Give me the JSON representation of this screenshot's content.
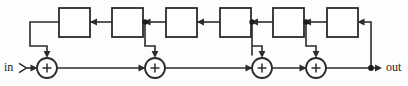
{
  "diagram": {
    "type": "signal-flow-block-diagram",
    "canvas": {
      "width": 408,
      "height": 86,
      "background": "#ffffff"
    },
    "stroke_color": "#2b2b2b",
    "labels": {
      "input": "in",
      "output": "out"
    },
    "delay_blocks": [
      {
        "id": "delay-1",
        "label": "",
        "x": 59,
        "y": 8,
        "w": 31,
        "h": 29
      },
      {
        "id": "delay-2",
        "label": "",
        "x": 112,
        "y": 8,
        "w": 31,
        "h": 29
      },
      {
        "id": "delay-3",
        "label": "",
        "x": 166,
        "y": 8,
        "w": 31,
        "h": 29
      },
      {
        "id": "delay-4",
        "label": "",
        "x": 220,
        "y": 8,
        "w": 31,
        "h": 29
      },
      {
        "id": "delay-5",
        "label": "",
        "x": 273,
        "y": 8,
        "w": 31,
        "h": 29
      },
      {
        "id": "delay-6",
        "label": "",
        "x": 327,
        "y": 8,
        "w": 31,
        "h": 29
      }
    ],
    "adders": [
      {
        "id": "adder-1",
        "label": "+",
        "cx": 47,
        "cy": 68,
        "r": 10
      },
      {
        "id": "adder-2",
        "label": "+",
        "cx": 155,
        "cy": 68,
        "r": 10
      },
      {
        "id": "adder-3",
        "label": "+",
        "cx": 262,
        "cy": 68,
        "r": 10
      },
      {
        "id": "adder-4",
        "label": "+",
        "cx": 316,
        "cy": 68,
        "r": 10
      }
    ],
    "junctions": [
      {
        "id": "junction-1",
        "cx": 145,
        "cy": 22
      },
      {
        "id": "junction-2",
        "cx": 252,
        "cy": 22
      },
      {
        "id": "junction-3",
        "cx": 306,
        "cy": 22
      },
      {
        "id": "junction-4",
        "cx": 371,
        "cy": 68
      }
    ],
    "counts": {
      "delay_blocks": 6,
      "adders": 4,
      "junctions": 4
    }
  }
}
